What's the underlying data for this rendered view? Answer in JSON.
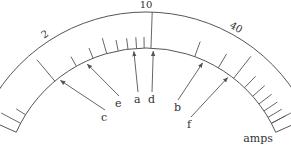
{
  "diagram": {
    "type": "log-scale-ammeter",
    "unit_label": "amps",
    "scale_labels": [
      {
        "text": "0",
        "angle": -62
      },
      {
        "text": "2",
        "angle": -33
      },
      {
        "text": "10",
        "angle": 0
      },
      {
        "text": "40",
        "angle": 29
      },
      {
        "text": "100",
        "angle": 62
      }
    ],
    "pointer_labels": [
      {
        "text": "a",
        "x": 136,
        "y": 100,
        "tip_angle": -5
      },
      {
        "text": "b",
        "x": 176,
        "y": 108,
        "tip_angle": 24
      },
      {
        "text": "c",
        "x": 103,
        "y": 118,
        "tip_angle": -38
      },
      {
        "text": "d",
        "x": 150,
        "y": 100,
        "tip_angle": 3
      },
      {
        "text": "e",
        "x": 117,
        "y": 104,
        "tip_angle": -25
      },
      {
        "text": "f",
        "x": 189,
        "y": 125,
        "tip_angle": 36
      }
    ],
    "colors": {
      "line": "#555555",
      "text": "#333333",
      "background": "#ffffff"
    }
  }
}
